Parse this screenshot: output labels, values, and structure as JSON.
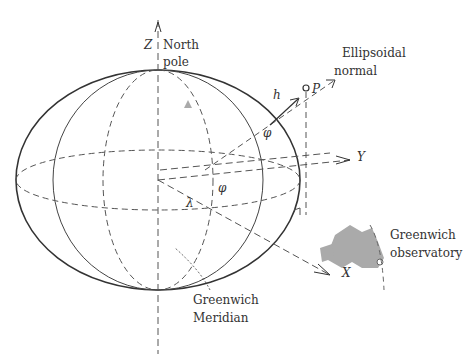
{
  "diagram": {
    "axes": {
      "z": "Z",
      "y": "Y",
      "x": "X"
    },
    "labels": {
      "north_pole_line1": "North",
      "north_pole_line2": "pole",
      "ellipsoidal_normal_line1": "Ellipsoidal",
      "ellipsoidal_normal_line2": "normal",
      "point": "P",
      "height": "h",
      "latitude": "φ",
      "longitude": "λ",
      "greenwich_meridian_line1": "Greenwich",
      "greenwich_meridian_line2": "Meridian",
      "greenwich_observatory_line1": "Greenwich",
      "greenwich_observatory_line2": "observatory"
    },
    "colors": {
      "line": "#333333",
      "dashed": "#555555",
      "landmass": "#aaaaaa"
    }
  }
}
